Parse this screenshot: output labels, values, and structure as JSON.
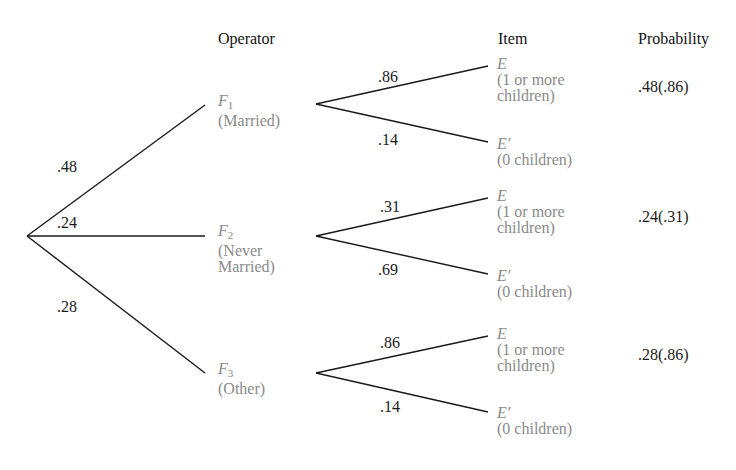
{
  "headers": {
    "operator": "Operator",
    "item": "Item",
    "probability": "Probability"
  },
  "colors": {
    "line": "#1a1a1a",
    "text": "#1a1a1a",
    "secondary_text": "#8a8a8a",
    "background": "#ffffff"
  },
  "root_branches": [
    {
      "label": ".48"
    },
    {
      "label": ".24"
    },
    {
      "label": ".28"
    }
  ],
  "operators": [
    {
      "symbol": "F",
      "subscript": "1",
      "desc_line1": "(Married)",
      "desc_line2": "",
      "branch_E_label": ".86",
      "branch_Eprime_label": ".14",
      "probability": ".48(.86)"
    },
    {
      "symbol": "F",
      "subscript": "2",
      "desc_line1": "(Never",
      "desc_line2": "Married)",
      "branch_E_label": ".31",
      "branch_Eprime_label": ".69",
      "probability": ".24(.31)"
    },
    {
      "symbol": "F",
      "subscript": "3",
      "desc_line1": "(Other)",
      "desc_line2": "",
      "branch_E_label": ".86",
      "branch_Eprime_label": ".14",
      "probability": ".28(.86)"
    }
  ],
  "items": {
    "E_symbol": "E",
    "E_desc_line1": "(1 or more",
    "E_desc_line2": "children)",
    "Eprime_symbol": "E′",
    "Eprime_desc": "(0 children)"
  }
}
